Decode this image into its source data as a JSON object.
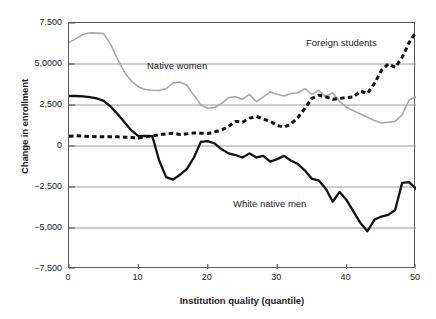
{
  "chart_data": {
    "type": "line",
    "title": "",
    "xlabel": "Institution quality (quantile)",
    "ylabel": "Change in enrollment",
    "xlim": [
      0,
      50
    ],
    "ylim": [
      -7500,
      7500
    ],
    "grid": true,
    "grid_axis": "y",
    "legend_position": "inline-annotations",
    "xticks": [
      "0",
      "10",
      "20",
      "30",
      "40",
      "50"
    ],
    "xtick_values": [
      0,
      10,
      20,
      30,
      40,
      50
    ],
    "yticks": [
      "7,500",
      "5,0000",
      "2,500",
      "0",
      "−2,500",
      "−5,000",
      "−7,500"
    ],
    "ytick_values": [
      7500,
      5000,
      2500,
      0,
      -2500,
      -5000,
      -7500
    ],
    "x": [
      0,
      1,
      2,
      3,
      4,
      5,
      6,
      7,
      8,
      9,
      10,
      11,
      12,
      13,
      14,
      15,
      16,
      17,
      18,
      19,
      20,
      21,
      22,
      23,
      24,
      25,
      26,
      27,
      28,
      29,
      30,
      31,
      32,
      33,
      34,
      35,
      36,
      37,
      38,
      39,
      40,
      41,
      42,
      43,
      44,
      45,
      46,
      47,
      48,
      49,
      50
    ],
    "series": [
      {
        "name": "Native women",
        "color": "#a8a8a8",
        "style": "solid-thin",
        "values": [
          6300,
          6550,
          6800,
          6900,
          6880,
          6850,
          6200,
          5300,
          4500,
          3950,
          3600,
          3450,
          3400,
          3380,
          3500,
          3850,
          3900,
          3700,
          3100,
          2500,
          2300,
          2350,
          2600,
          2950,
          3000,
          2850,
          3150,
          2700,
          3000,
          3300,
          3150,
          3050,
          3200,
          3250,
          3500,
          3150,
          3400,
          3000,
          3250,
          2700,
          2350,
          2150,
          1950,
          1750,
          1550,
          1400,
          1450,
          1500,
          1900,
          2800,
          3000
        ]
      },
      {
        "name": "White native men",
        "color": "#121212",
        "style": "solid-thick",
        "values": [
          3050,
          3050,
          3020,
          2980,
          2900,
          2750,
          2400,
          1950,
          1450,
          950,
          600,
          620,
          600,
          -900,
          -1900,
          -2050,
          -1750,
          -1400,
          -700,
          250,
          300,
          150,
          -200,
          -450,
          -550,
          -700,
          -450,
          -700,
          -600,
          -950,
          -800,
          -600,
          -900,
          -1100,
          -1500,
          -2000,
          -2100,
          -2600,
          -3400,
          -2800,
          -3300,
          -4000,
          -4700,
          -5200,
          -4500,
          -4300,
          -4200,
          -3900,
          -2250,
          -2200,
          -2600
        ]
      },
      {
        "name": "Foreign students",
        "color": "#121212",
        "style": "dashed-thick",
        "values": [
          600,
          620,
          600,
          580,
          560,
          560,
          570,
          560,
          540,
          520,
          480,
          560,
          620,
          680,
          740,
          780,
          700,
          740,
          800,
          780,
          760,
          860,
          980,
          1200,
          1500,
          1450,
          1700,
          1800,
          1650,
          1500,
          1250,
          1150,
          1350,
          1750,
          2300,
          2900,
          3100,
          3000,
          2850,
          2900,
          2950,
          3000,
          3350,
          3200,
          3800,
          4600,
          5000,
          4800,
          5400,
          6300,
          6950
        ]
      }
    ],
    "annotations": [
      {
        "text": "Native women",
        "series": "Native women"
      },
      {
        "text": "Foreign students",
        "series": "Foreign students"
      },
      {
        "text": "White native men",
        "series": "White native men"
      }
    ]
  }
}
